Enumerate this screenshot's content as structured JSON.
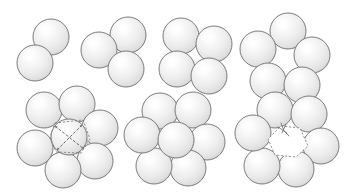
{
  "figure": {
    "title": "Sphere packing cluster configurations",
    "background_color": "#ffffff",
    "width": 346,
    "height": 195,
    "sphere_style": {
      "fill_center_color": "#fbfbfb",
      "fill_edge_color": "#d8d8d8",
      "stroke_color": "#6e6e6e",
      "stroke_width": 0.9,
      "highlight_color": "#ffffff",
      "radius": 18
    },
    "annotation_style": {
      "line_color": "#6b6b6b",
      "dash_color": "#7a7a7a",
      "line_width": 0.8
    }
  },
  "clusters": [
    {
      "id": "cluster-2",
      "label": "2-sphere cluster",
      "count": 2,
      "row": "top",
      "position": 1,
      "has_center_sphere": false,
      "has_annotation": false,
      "spheres": [
        {
          "cx": 51,
          "cy": 37,
          "r": 18
        },
        {
          "cx": 35,
          "cy": 63,
          "r": 18
        }
      ]
    },
    {
      "id": "cluster-3",
      "label": "3-sphere cluster",
      "count": 3,
      "row": "top",
      "position": 2,
      "has_center_sphere": false,
      "has_annotation": false,
      "spheres": [
        {
          "cx": 128,
          "cy": 35,
          "r": 18
        },
        {
          "cx": 99,
          "cy": 50,
          "r": 18
        },
        {
          "cx": 126,
          "cy": 69,
          "r": 18
        }
      ]
    },
    {
      "id": "cluster-4",
      "label": "4-sphere cluster",
      "count": 4,
      "row": "top",
      "position": 3,
      "has_center_sphere": false,
      "has_annotation": false,
      "spheres": [
        {
          "cx": 181,
          "cy": 36,
          "r": 18
        },
        {
          "cx": 214,
          "cy": 44,
          "r": 18
        },
        {
          "cx": 177,
          "cy": 69,
          "r": 18
        },
        {
          "cx": 209,
          "cy": 76,
          "r": 18
        }
      ]
    },
    {
      "id": "cluster-5",
      "label": "5-sphere ring cluster",
      "count": 5,
      "row": "top",
      "position": 4,
      "has_center_sphere": false,
      "has_annotation": false,
      "spheres": [
        {
          "cx": 288,
          "cy": 31,
          "r": 18
        },
        {
          "cx": 258,
          "cy": 49,
          "r": 18
        },
        {
          "cx": 312,
          "cy": 55,
          "r": 18
        },
        {
          "cx": 268,
          "cy": 81,
          "r": 18
        },
        {
          "cx": 302,
          "cy": 85,
          "r": 18
        }
      ]
    },
    {
      "id": "cluster-7-annotated",
      "label": "7-sphere cluster with central sphere diameter annotation",
      "count": 7,
      "row": "bottom",
      "position": 1,
      "has_center_sphere": true,
      "has_annotation": true,
      "annotation_type": "diameter-cross",
      "spheres": [
        {
          "cx": 44,
          "cy": 110,
          "r": 18
        },
        {
          "cx": 77,
          "cy": 104,
          "r": 18
        },
        {
          "cx": 100,
          "cy": 128,
          "r": 18
        },
        {
          "cx": 95,
          "cy": 161,
          "r": 18
        },
        {
          "cx": 63,
          "cy": 170,
          "r": 18
        },
        {
          "cx": 35,
          "cy": 148,
          "r": 18
        },
        {
          "cx": 69,
          "cy": 137,
          "r": 18
        }
      ],
      "center_sphere": {
        "cx": 69,
        "cy": 137,
        "r": 18
      },
      "annotation": {
        "cross_arms": [
          {
            "x1": 55,
            "y1": 126,
            "x2": 84,
            "y2": 149
          },
          {
            "x1": 82,
            "y1": 125,
            "x2": 57,
            "y2": 150
          }
        ],
        "interstice_polygon": "55,123 83,120 90,139 81,153 56,152 50,137"
      }
    },
    {
      "id": "cluster-7-packed",
      "label": "7-sphere close-packed cluster",
      "count": 7,
      "row": "bottom",
      "position": 2,
      "has_center_sphere": true,
      "has_annotation": false,
      "spheres": [
        {
          "cx": 160,
          "cy": 111,
          "r": 18
        },
        {
          "cx": 193,
          "cy": 110,
          "r": 18
        },
        {
          "cx": 207,
          "cy": 142,
          "r": 18
        },
        {
          "cx": 188,
          "cy": 168,
          "r": 18
        },
        {
          "cx": 154,
          "cy": 166,
          "r": 18
        },
        {
          "cx": 142,
          "cy": 135,
          "r": 18
        },
        {
          "cx": 176,
          "cy": 140,
          "r": 18
        }
      ],
      "center_sphere": {
        "cx": 176,
        "cy": 140,
        "r": 18
      }
    },
    {
      "id": "cluster-6-ring-hole",
      "label": "6-sphere ring with empty central interstice",
      "count": 6,
      "row": "bottom",
      "position": 3,
      "has_center_sphere": false,
      "has_annotation": true,
      "annotation_type": "interstice-hole",
      "spheres": [
        {
          "cx": 275,
          "cy": 110,
          "r": 18
        },
        {
          "cx": 309,
          "cy": 114,
          "r": 18
        },
        {
          "cx": 321,
          "cy": 146,
          "r": 18
        },
        {
          "cx": 296,
          "cy": 169,
          "r": 18
        },
        {
          "cx": 262,
          "cy": 166,
          "r": 18
        },
        {
          "cx": 253,
          "cy": 133,
          "r": 18
        }
      ],
      "annotation": {
        "hole_polygon": "281,126 300,128 308,146 296,157 275,155 268,139",
        "marker_lines": [
          {
            "x1": 281,
            "y1": 123,
            "x2": 284,
            "y2": 131
          },
          {
            "x1": 284,
            "y1": 131,
            "x2": 289,
            "y2": 136
          },
          {
            "x1": 286,
            "y1": 124,
            "x2": 282,
            "y2": 133
          },
          {
            "x1": 278,
            "y1": 127,
            "x2": 287,
            "y2": 133
          }
        ]
      }
    }
  ]
}
